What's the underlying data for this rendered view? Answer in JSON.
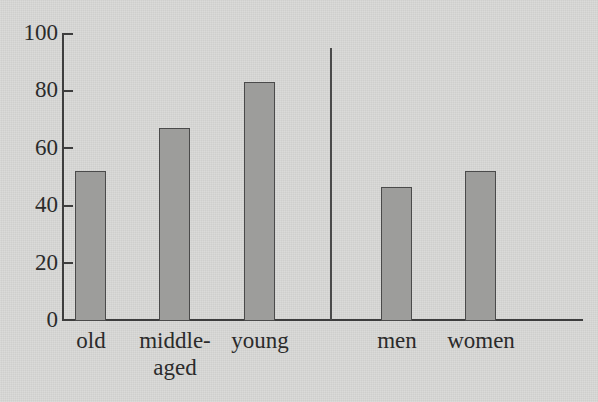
{
  "chart_data": {
    "type": "bar",
    "title": "",
    "subtitle": "",
    "xlabel": "",
    "ylabel": "",
    "categories": [
      "old",
      "middle-\naged",
      "young",
      "men",
      "women"
    ],
    "values": [
      52,
      67,
      83,
      46.5,
      52
    ],
    "ylim": [
      0,
      100
    ],
    "yticks": [
      0,
      20,
      40,
      60,
      80,
      100
    ],
    "ytick_labels": [
      "0",
      "20",
      "40",
      "60",
      "80",
      "100"
    ],
    "grid": false,
    "legend": null,
    "groups": [
      {
        "name": "age",
        "categories": [
          "old",
          "middle-aged",
          "young"
        ]
      },
      {
        "name": "gender",
        "categories": [
          "men",
          "women"
        ]
      }
    ],
    "annotations": [
      {
        "type": "vertical-divider",
        "note": "separator line between age group and gender group"
      }
    ],
    "colors": {
      "background": "#d7d7d5",
      "bar_fill": "#9d9d9b",
      "bar_stroke": "#4a4a4a",
      "axis": "#3d3d3d",
      "text": "#2b2b2b"
    }
  },
  "axis": {
    "y_ticks": [
      {
        "label": "100",
        "value": 100
      },
      {
        "label": "80",
        "value": 80
      },
      {
        "label": "60",
        "value": 60
      },
      {
        "label": "40",
        "value": 40
      },
      {
        "label": "20",
        "value": 20
      },
      {
        "label": "0",
        "value": 0
      }
    ]
  },
  "bars": [
    {
      "label": "old",
      "value": 52,
      "label_line1": "old",
      "label_line2": ""
    },
    {
      "label": "middle-aged",
      "value": 67,
      "label_line1": "middle-",
      "label_line2": "aged"
    },
    {
      "label": "young",
      "value": 83,
      "label_line1": "young",
      "label_line2": ""
    },
    {
      "label": "men",
      "value": 46.5,
      "label_line1": "men",
      "label_line2": ""
    },
    {
      "label": "women",
      "value": 52,
      "label_line1": "women",
      "label_line2": ""
    }
  ]
}
